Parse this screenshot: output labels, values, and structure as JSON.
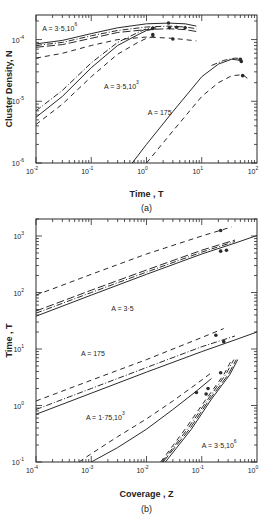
{
  "chart_data": [
    {
      "id": "a",
      "type": "line",
      "panel_label": "(a)",
      "xlabel": "Time , T",
      "ylabel": "Cluster Density, N",
      "xscale": "log",
      "yscale": "log",
      "xlim": [
        0.01,
        100
      ],
      "ylim": [
        1e-06,
        0.00025
      ],
      "xticks": [
        0.01,
        0.1,
        1,
        10,
        100
      ],
      "xtick_labels": [
        {
          "base": "10",
          "exp": "-2"
        },
        {
          "base": "10",
          "exp": "-1"
        },
        {
          "base": "10",
          "exp": "0"
        },
        {
          "base": "10",
          "exp": "1"
        },
        {
          "base": "10",
          "exp": "2"
        }
      ],
      "yticks": [
        1e-06,
        1e-05,
        0.0001
      ],
      "ytick_labels": [
        {
          "base": "10",
          "exp": "-6"
        },
        {
          "base": "10",
          "exp": "-5"
        },
        {
          "base": "10",
          "exp": "-4"
        }
      ],
      "annotations": [
        {
          "text": "A = 3·5,10",
          "sup": "6",
          "x": 0.013,
          "y": 0.00014
        },
        {
          "text": "A = 3·5,10",
          "sup": "3",
          "x": 0.17,
          "y": 1.6e-05
        },
        {
          "text": "A = 175",
          "x": 1.05,
          "y": 6e-06
        }
      ],
      "series": [
        {
          "name": "A=3.5e6 solid",
          "group": "A=3.5e6",
          "style": "solid",
          "x": [
            0.01,
            0.03,
            0.1,
            0.3,
            1,
            2.5,
            5,
            8
          ],
          "y": [
            8.5e-05,
            9.7e-05,
            0.000125,
            0.000155,
            0.00018,
            0.000185,
            0.00018,
            0.000165
          ]
        },
        {
          "name": "A=3.5e6 dash-dot",
          "group": "A=3.5e6",
          "style": "dashdot",
          "x": [
            0.01,
            0.03,
            0.1,
            0.3,
            1,
            2.5,
            5,
            8
          ],
          "y": [
            8e-05,
            9e-05,
            0.000115,
            0.00014,
            0.00016,
            0.000165,
            0.00016,
            0.00015
          ]
        },
        {
          "name": "A=3.5e6 long dash",
          "group": "A=3.5e6",
          "style": "longdash",
          "x": [
            0.01,
            0.03,
            0.1,
            0.3,
            1,
            2.5,
            5,
            8
          ],
          "y": [
            7.5e-05,
            8.3e-05,
            0.000105,
            0.00013,
            0.000145,
            0.00015,
            0.000145,
            0.000135
          ]
        },
        {
          "name": "A=3.5e6 short dash",
          "group": "A=3.5e6",
          "style": "dash",
          "x": [
            0.01,
            0.03,
            0.1,
            0.3,
            1,
            3,
            8
          ],
          "y": [
            5e-05,
            6e-05,
            8e-05,
            0.0001,
            0.00011,
            0.000105,
            9.5e-05
          ]
        },
        {
          "name": "A=3.5e3 solid",
          "group": "A=3.5e3",
          "style": "solid",
          "x": [
            0.01,
            0.03,
            0.1,
            0.3,
            0.7,
            1,
            1.5
          ],
          "y": [
            5.5e-06,
            1.2e-05,
            3.5e-05,
            8e-05,
            0.00012,
            0.00014,
            0.00015
          ]
        },
        {
          "name": "A=3.5e3 dash-dot",
          "group": "A=3.5e3",
          "style": "dashdot",
          "x": [
            0.01,
            0.03,
            0.1,
            0.3,
            0.7,
            1,
            1.5
          ],
          "y": [
            7e-06,
            1.5e-05,
            4.2e-05,
            9e-05,
            0.00013,
            0.00015,
            0.00016
          ]
        },
        {
          "name": "A=3.5e3 short dash",
          "group": "A=3.5e3",
          "style": "dash",
          "x": [
            0.01,
            0.03,
            0.1,
            0.3,
            0.7,
            1,
            1.5
          ],
          "y": [
            4.2e-06,
            9e-06,
            2.5e-05,
            5.8e-05,
            9e-05,
            0.000105,
            0.000115
          ]
        },
        {
          "name": "A=175 solid",
          "group": "A=175",
          "style": "solid",
          "x": [
            0.55,
            1,
            3,
            10,
            20,
            35,
            50
          ],
          "y": [
            1e-06,
            2e-06,
            6.8e-06,
            2.5e-05,
            4e-05,
            4.8e-05,
            4.6e-05
          ]
        },
        {
          "name": "A=175 dash-dot",
          "group": "A=175",
          "style": "dashdot",
          "x": [
            15,
            25,
            40,
            55
          ],
          "y": [
            3.8e-05,
            4.6e-05,
            5e-05,
            4.9e-05
          ]
        },
        {
          "name": "A=175 short dash",
          "group": "A=175",
          "style": "dash",
          "x": [
            1,
            3,
            10,
            20,
            35,
            55,
            70
          ],
          "y": [
            1e-06,
            3.3e-06,
            1.2e-05,
            2e-05,
            2.6e-05,
            2.7e-05,
            2.3e-05
          ]
        }
      ],
      "markers": {
        "x": [
          2.5,
          1.3,
          2.6,
          3.5,
          5,
          1.3,
          3,
          50,
          52,
          55
        ],
        "y": [
          0.000185,
          0.000152,
          0.000155,
          0.000158,
          0.000155,
          0.00012,
          0.000102,
          4.8e-05,
          4.4e-05,
          2.6e-05
        ]
      }
    },
    {
      "id": "b",
      "type": "line",
      "panel_label": "(b)",
      "xlabel": "Coverage , Z",
      "ylabel": "Time , T",
      "xscale": "log",
      "yscale": "log",
      "xlim": [
        0.0001,
        1
      ],
      "ylim": [
        0.1,
        2000
      ],
      "xticks": [
        0.0001,
        0.001,
        0.01,
        0.1,
        1
      ],
      "xtick_labels": [
        {
          "base": "10",
          "exp": "-4"
        },
        {
          "base": "10",
          "exp": "-3"
        },
        {
          "base": "10",
          "exp": "-2"
        },
        {
          "base": "10",
          "exp": "-1"
        },
        {
          "base": "10",
          "exp": "0"
        }
      ],
      "yticks": [
        0.1,
        1,
        10,
        100,
        1000
      ],
      "ytick_labels": [
        {
          "base": "10",
          "exp": "-1"
        },
        {
          "base": "10",
          "exp": "0"
        },
        {
          "base": "10",
          "exp": "1"
        },
        {
          "base": "10",
          "exp": "2"
        },
        {
          "base": "10",
          "exp": "3"
        }
      ],
      "annotations": [
        {
          "text": "A = 3·5",
          "x": 0.0023,
          "y": 48
        },
        {
          "text": "A = 175",
          "x": 0.00065,
          "y": 7.5
        },
        {
          "text": "A = 1·75,10",
          "sup": "3",
          "x": 0.0008,
          "y": 0.55
        },
        {
          "text": "A = 3·5,10",
          "sup": "6",
          "x": 0.1,
          "y": 0.18
        }
      ],
      "series": [
        {
          "name": "A=3.5 short dash",
          "group": "A=3.5",
          "style": "dash",
          "x": [
            0.0001,
            0.001,
            0.01,
            0.1,
            0.35
          ],
          "y": [
            90,
            210,
            480,
            1000,
            1450
          ]
        },
        {
          "name": "A=3.5 long dash",
          "group": "A=3.5",
          "style": "longdash",
          "x": [
            0.0001,
            0.001,
            0.01,
            0.1,
            0.4
          ],
          "y": [
            47,
            110,
            250,
            560,
            850
          ]
        },
        {
          "name": "A=3.5 dash-dot",
          "group": "A=3.5",
          "style": "dashdot",
          "x": [
            0.0001,
            0.001,
            0.01,
            0.1,
            0.4
          ],
          "y": [
            43,
            100,
            230,
            520,
            800
          ]
        },
        {
          "name": "A=3.5 solid",
          "group": "A=3.5",
          "style": "solid",
          "x": [
            0.0001,
            0.001,
            0.01,
            0.1,
            0.4,
            1
          ],
          "y": [
            38,
            90,
            210,
            480,
            750,
            1020
          ]
        },
        {
          "name": "A=175 short dash",
          "group": "A=175",
          "style": "dash",
          "x": [
            0.0001,
            0.001,
            0.01,
            0.1,
            0.25
          ],
          "y": [
            1.2,
            2.8,
            6.5,
            16,
            23
          ]
        },
        {
          "name": "A=175 dash-dot",
          "group": "A=175",
          "style": "dashdot",
          "x": [
            0.0001,
            0.001,
            0.01,
            0.1,
            0.4
          ],
          "y": [
            0.85,
            2.0,
            4.7,
            11,
            17
          ]
        },
        {
          "name": "A=175 solid",
          "group": "A=175",
          "style": "solid",
          "x": [
            0.0001,
            0.001,
            0.01,
            0.1,
            0.4,
            1
          ],
          "y": [
            0.7,
            1.65,
            3.9,
            9,
            14.5,
            20
          ]
        },
        {
          "name": "A=1.75e3 short dash",
          "group": "A=1.75e3",
          "style": "dash",
          "x": [
            0.0006,
            0.001,
            0.003,
            0.01,
            0.03,
            0.08,
            0.15
          ],
          "y": [
            0.1,
            0.14,
            0.28,
            0.58,
            1.2,
            2.4,
            3.8
          ]
        },
        {
          "name": "A=1.75e3 solid",
          "group": "A=1.75e3",
          "style": "solid",
          "x": [
            0.001,
            0.003,
            0.01,
            0.03,
            0.08,
            0.15
          ],
          "y": [
            0.1,
            0.18,
            0.38,
            0.85,
            1.8,
            3.0
          ]
        },
        {
          "name": "A=3.5e6 line 1",
          "group": "A=3.5e6",
          "style": "dash",
          "x": [
            0.018,
            0.05,
            0.12,
            0.25,
            0.35
          ],
          "y": [
            0.1,
            0.38,
            1.3,
            3.5,
            6.5
          ]
        },
        {
          "name": "A=3.5e6 line 2",
          "group": "A=3.5e6",
          "style": "dashdot",
          "x": [
            0.019,
            0.055,
            0.13,
            0.27,
            0.38
          ],
          "y": [
            0.1,
            0.38,
            1.3,
            3.5,
            6.5
          ]
        },
        {
          "name": "A=3.5e6 line 3",
          "group": "A=3.5e6",
          "style": "longdash",
          "x": [
            0.02,
            0.06,
            0.14,
            0.3,
            0.42
          ],
          "y": [
            0.1,
            0.38,
            1.3,
            3.5,
            6.5
          ]
        },
        {
          "name": "A=3.5e6 line 4",
          "group": "A=3.5e6",
          "style": "solid",
          "x": [
            0.022,
            0.065,
            0.15,
            0.32,
            0.45
          ],
          "y": [
            0.1,
            0.38,
            1.3,
            3.5,
            6.5
          ]
        }
      ],
      "markers": {
        "x": [
          0.22,
          0.22,
          0.28,
          0.18,
          0.25,
          0.08,
          0.13,
          0.12,
          0.22
        ],
        "y": [
          1250,
          540,
          560,
          17.5,
          13.5,
          1.7,
          2.0,
          1.6,
          3.8
        ]
      }
    }
  ]
}
